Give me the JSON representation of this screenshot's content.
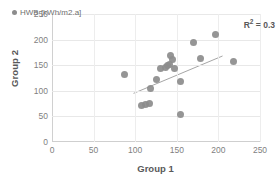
{
  "chart_data": {
    "type": "scatter",
    "title": "",
    "xlabel": "Group 1",
    "ylabel": "Group 2",
    "xlim": [
      0,
      250
    ],
    "ylim": [
      0,
      250
    ],
    "xticks": [
      0,
      50,
      100,
      150,
      200,
      250
    ],
    "yticks": [
      0,
      50,
      100,
      150,
      200,
      250
    ],
    "grid": "horizontal-and-vertical",
    "legend_position": "top-left",
    "series": [
      {
        "name": "HWB [kWh/m2.a]",
        "marker": "circle",
        "color": "#8c8c8c",
        "points": [
          {
            "x": 87,
            "y": 131
          },
          {
            "x": 108,
            "y": 72
          },
          {
            "x": 112,
            "y": 73
          },
          {
            "x": 117,
            "y": 76
          },
          {
            "x": 118,
            "y": 105
          },
          {
            "x": 125,
            "y": 122
          },
          {
            "x": 131,
            "y": 144
          },
          {
            "x": 136,
            "y": 145
          },
          {
            "x": 139,
            "y": 149
          },
          {
            "x": 141,
            "y": 152
          },
          {
            "x": 143,
            "y": 168
          },
          {
            "x": 145,
            "y": 161
          },
          {
            "x": 147,
            "y": 144
          },
          {
            "x": 154,
            "y": 118
          },
          {
            "x": 155,
            "y": 53
          },
          {
            "x": 170,
            "y": 194
          },
          {
            "x": 178,
            "y": 164
          },
          {
            "x": 196,
            "y": 209
          },
          {
            "x": 218,
            "y": 158
          }
        ]
      }
    ],
    "trendline": {
      "type": "linear",
      "x_start": 98,
      "y_start": 95,
      "x_end": 205,
      "y_end": 168,
      "color": "#a6a6a6"
    },
    "annotations": [
      {
        "name": "r2",
        "text": "R² = 0.3",
        "value": 0.3
      }
    ]
  },
  "legend": {
    "entries": [
      {
        "label": "HWB [kWh/m2.a]",
        "marker_icon": "circle-marker-icon"
      }
    ]
  },
  "annotation": {
    "r2_prefix": "R",
    "r2_exponent": "2",
    "r2_value": " = 0.3"
  },
  "axes": {
    "x_title": "Group 1",
    "y_title": "Group 2"
  }
}
